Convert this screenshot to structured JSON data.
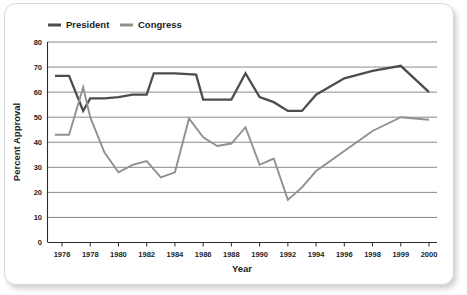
{
  "chart_data": {
    "type": "line",
    "title": "",
    "xlabel": "Year",
    "ylabel": "Percent Approval",
    "xlim": [
      1975.5,
      2000
    ],
    "ylim": [
      0,
      80
    ],
    "yticks": [
      0,
      10,
      20,
      30,
      40,
      50,
      60,
      70,
      80
    ],
    "ytick_labels": [
      "0",
      "10",
      "20",
      "30",
      "40",
      "50",
      "60",
      "70",
      "80"
    ],
    "xticks": [
      1976,
      1978,
      1980,
      1982,
      1984,
      1986,
      1988,
      1990,
      1992,
      1994,
      1996,
      1998,
      1999,
      2000
    ],
    "xtick_labels": [
      "1976",
      "1978",
      "1980",
      "1982",
      "1984",
      "1986",
      "1988",
      "1990",
      "1992",
      "1994",
      "1996",
      "1998",
      "1999",
      "2000"
    ],
    "grid": true,
    "legend_position": "top-left",
    "series": [
      {
        "name": "President",
        "color": "#4d4d4d",
        "x": [
          1975.5,
          1976.5,
          1977.5,
          1978,
          1979,
          1980,
          1981,
          1982,
          1982.5,
          1984,
          1985.5,
          1986,
          1987.5,
          1988,
          1989,
          1990,
          1991,
          1992,
          1993,
          1994,
          1996,
          1998,
          1999,
          2000
        ],
        "values": [
          66.5,
          66.5,
          52.5,
          57.5,
          57.5,
          58,
          59,
          59,
          67.5,
          67.5,
          67,
          57,
          57,
          57,
          67.5,
          58,
          56,
          52.5,
          52.5,
          59,
          65.5,
          68.5,
          70.5,
          60
        ]
      },
      {
        "name": "Congress",
        "color": "#909090",
        "x": [
          1975.5,
          1976.5,
          1977.5,
          1978,
          1979,
          1980,
          1981,
          1982,
          1983,
          1984,
          1985,
          1986,
          1987,
          1988,
          1989,
          1990,
          1991,
          1992,
          1993,
          1994,
          1996,
          1998,
          1999,
          2000
        ],
        "values": [
          43,
          43,
          62,
          50,
          36,
          28,
          31,
          32.5,
          26,
          28,
          49.5,
          42,
          38.5,
          39.5,
          46,
          31,
          33.5,
          17,
          22,
          28.5,
          36.5,
          44.5,
          50,
          49
        ]
      }
    ]
  },
  "legend": {
    "items": [
      {
        "label": "President",
        "color": "#4d4d4d"
      },
      {
        "label": "Congress",
        "color": "#909090"
      }
    ]
  },
  "axes": {
    "y_title": "Percent Approval",
    "x_title": "Year"
  }
}
